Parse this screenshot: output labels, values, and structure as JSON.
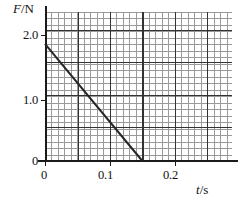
{
  "chart_data": {
    "type": "line",
    "title": "",
    "xlabel": "t/s",
    "ylabel": "F/N",
    "xlabel_var": "t",
    "xlabel_unit": "/s",
    "ylabel_var": "F",
    "ylabel_unit": "/N",
    "xlim": [
      0,
      0.288
    ],
    "ylim": [
      0,
      2.29
    ],
    "xticks": [
      0,
      0.1,
      0.2
    ],
    "xtick_labels": [
      "0",
      "0.1",
      "0.2"
    ],
    "yticks": [
      0,
      1.0,
      2.0
    ],
    "ytick_labels": [
      "0",
      "1.0",
      "2.0"
    ],
    "grid": true,
    "grid_minor_step_x": 0.01,
    "grid_minor_step_y": 0.1,
    "grid_major_step_x": 0.05,
    "grid_major_step_y": 0.5,
    "legend": null,
    "series": [
      {
        "name": "F(t)",
        "x": [
          0,
          0.15
        ],
        "values": [
          1.8,
          0
        ],
        "color": "#262626",
        "linewidth": 2,
        "style": "solid"
      }
    ]
  },
  "figure": {
    "background": "#ffffff",
    "axis_color": "#1a1a1a",
    "grid_minor_color": "#9a9a9a",
    "grid_major_color": "#333333"
  }
}
